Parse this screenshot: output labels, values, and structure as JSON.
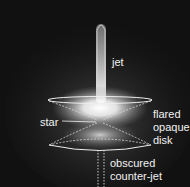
{
  "diagram": {
    "labels": {
      "jet": "jet",
      "star": "star",
      "disk_line1": "flared",
      "disk_line2": "opaque",
      "disk_line3": "disk",
      "counterjet_line1": "obscured",
      "counterjet_line2": "counter-jet"
    },
    "colors": {
      "background": "#111111",
      "glow": "#ffffff",
      "outline": "#e8e8e8"
    }
  }
}
